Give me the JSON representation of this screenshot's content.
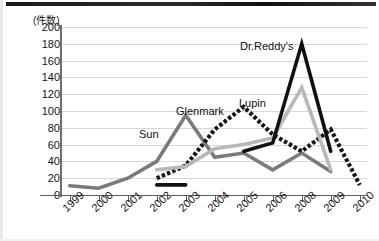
{
  "chart_data": {
    "type": "line",
    "title": "",
    "xlabel": "",
    "ylabel": "(件数)",
    "ylim": [
      0,
      200
    ],
    "ytick_step": 20,
    "yticks": [
      200,
      180,
      160,
      140,
      120,
      100,
      80,
      60,
      40,
      20,
      0
    ],
    "categories": [
      "1999",
      "2000",
      "2001",
      "2002",
      "2003",
      "2004",
      "2005",
      "2006",
      "2008",
      "2009",
      "2010"
    ],
    "grid": true,
    "legend_position": "inline-annotations",
    "series": [
      {
        "name": "Sun",
        "style": "solid",
        "color": "#7a7a7a",
        "x": [
          "1999",
          "2000",
          "2001",
          "2002",
          "2003",
          "2004",
          "2005",
          "2006",
          "2008",
          "2009"
        ],
        "values": [
          11,
          8,
          20,
          40,
          95,
          45,
          50,
          30,
          50,
          28
        ]
      },
      {
        "name": "Glenmark",
        "style": "dotted",
        "color": "#141414",
        "x": [
          "2002",
          "2003",
          "2004",
          "2005",
          "2006",
          "2008",
          "2009",
          "2010"
        ],
        "values": [
          20,
          35,
          78,
          105,
          72,
          52,
          78,
          12
        ]
      },
      {
        "name": "Lupin",
        "style": "solid",
        "color": "#b8b8b8",
        "x": [
          "2002",
          "2003",
          "2004",
          "2005",
          "2006",
          "2008",
          "2009"
        ],
        "values": [
          30,
          34,
          55,
          60,
          68,
          128,
          30
        ]
      },
      {
        "name": "Dr.Reddy's",
        "style": "solid",
        "color": "#111111",
        "segments": [
          {
            "x": [
              "2002",
              "2003"
            ],
            "values": [
              12,
              12
            ]
          },
          {
            "x": [
              "2005",
              "2006",
              "2008",
              "2009"
            ],
            "values": [
              52,
              62,
              180,
              52
            ]
          }
        ]
      }
    ],
    "annotations": [
      {
        "text": "Sun",
        "x": 139,
        "y": 128
      },
      {
        "text": "Glenmark",
        "x": 176,
        "y": 105
      },
      {
        "text": "Lupin",
        "x": 239,
        "y": 97
      },
      {
        "text": "Dr.Reddy's",
        "x": 240,
        "y": 40
      }
    ]
  }
}
